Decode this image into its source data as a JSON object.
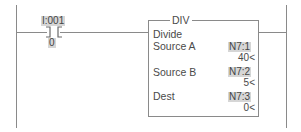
{
  "rung": {
    "contact": {
      "type": "XIC",
      "address": "I:001",
      "address_display": "I:001",
      "bit": "0"
    },
    "instruction": {
      "mnemonic": "DIV",
      "description": "Divide",
      "params": [
        {
          "label": "Source A",
          "address": "N7:1",
          "value": "40<"
        },
        {
          "label": "Source B",
          "address": "N7:2",
          "value": "5<"
        },
        {
          "label": "Dest",
          "address": "N7:3",
          "value": "0<"
        }
      ]
    }
  },
  "colors": {
    "line": "#8a8a8a",
    "tag_highlight": "#d6d6d6",
    "text": "#4a4a4a"
  }
}
